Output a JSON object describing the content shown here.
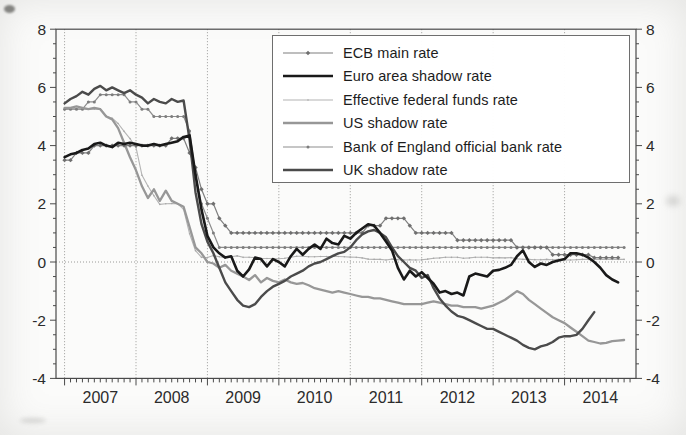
{
  "figure": {
    "background": "#fbfbfa",
    "frame_color": "#4a4a4a",
    "grid_color": "#9a9a98",
    "text_color": "#2b2b2b",
    "y_axis": {
      "min": -4,
      "max": 8,
      "tick_values": [
        8,
        6,
        4,
        2,
        0,
        -2,
        -4
      ],
      "tick_labels": [
        "8",
        "6",
        "4",
        "2",
        "0",
        "-2",
        "-4"
      ],
      "minor_tick_step": 0.5,
      "labels_on_both_sides": true
    },
    "x_axis": {
      "min": 2006.88,
      "max": 2015.0,
      "year_gridlines": [
        2007,
        2008,
        2009,
        2010,
        2011,
        2012,
        2013,
        2014
      ],
      "labels": [
        "2007",
        "2008",
        "2009",
        "2010",
        "2011",
        "2012",
        "2013",
        "2014"
      ],
      "minor_ticks": "monthly"
    }
  },
  "legend": {
    "position": "top-right",
    "items": [
      {
        "id": "ecb_main",
        "label": "ECB main rate"
      },
      {
        "id": "euro_shadow",
        "label": "Euro area shadow rate"
      },
      {
        "id": "fed_funds",
        "label": "Effective federal funds rate"
      },
      {
        "id": "us_shadow",
        "label": "US shadow rate"
      },
      {
        "id": "boe_rate",
        "label": "Bank of England official bank rate"
      },
      {
        "id": "uk_shadow",
        "label": "UK shadow rate"
      }
    ]
  },
  "chart_data": {
    "type": "line",
    "title": "",
    "xlabel": "",
    "ylabel": "",
    "ylim": [
      -4,
      8
    ],
    "xlim": [
      2006.88,
      2015.0
    ],
    "grid": "vertical year gridlines (dotted) + dotted zero line",
    "legend_position": "top-right inside frame",
    "x_unit": "monthly, value = year + (month-1)/12",
    "series": [
      {
        "id": "ecb_main",
        "name": "ECB main rate",
        "color": "#7f7f7f",
        "width": 1.2,
        "marker": "diamond",
        "marker_color": "#6f6f6f",
        "start": 2007.0,
        "values": [
          3.5,
          3.5,
          3.75,
          3.75,
          3.75,
          4.0,
          4.0,
          4.0,
          4.0,
          4.0,
          4.0,
          4.0,
          4.0,
          4.0,
          4.0,
          4.0,
          4.0,
          4.0,
          4.25,
          4.25,
          4.25,
          3.75,
          3.25,
          2.5,
          2.0,
          2.0,
          1.5,
          1.25,
          1.0,
          1.0,
          1.0,
          1.0,
          1.0,
          1.0,
          1.0,
          1.0,
          1.0,
          1.0,
          1.0,
          1.0,
          1.0,
          1.0,
          1.0,
          1.0,
          1.0,
          1.0,
          1.0,
          1.0,
          1.0,
          1.0,
          1.0,
          1.25,
          1.25,
          1.25,
          1.5,
          1.5,
          1.5,
          1.5,
          1.25,
          1.0,
          1.0,
          1.0,
          1.0,
          1.0,
          1.0,
          1.0,
          0.75,
          0.75,
          0.75,
          0.75,
          0.75,
          0.75,
          0.75,
          0.75,
          0.75,
          0.75,
          0.5,
          0.5,
          0.5,
          0.5,
          0.5,
          0.5,
          0.25,
          0.25,
          0.25,
          0.25,
          0.25,
          0.25,
          0.25,
          0.15,
          0.15,
          0.15,
          0.15,
          0.15
        ]
      },
      {
        "id": "euro_shadow",
        "name": "Euro area shadow rate",
        "color": "#191919",
        "width": 2.6,
        "marker": "none",
        "marker_color": "#191919",
        "start": 2007.0,
        "values": [
          3.6,
          3.7,
          3.75,
          3.85,
          3.9,
          4.05,
          4.1,
          4.0,
          3.95,
          4.1,
          4.05,
          4.1,
          4.05,
          4.0,
          4.0,
          4.05,
          4.0,
          4.05,
          4.1,
          4.15,
          4.3,
          4.35,
          3.0,
          1.8,
          0.9,
          0.5,
          0.3,
          0.15,
          0.2,
          -0.3,
          -0.5,
          -0.25,
          0.15,
          0.1,
          -0.15,
          0.1,
          0.0,
          -0.15,
          0.2,
          0.45,
          0.25,
          0.45,
          0.6,
          0.45,
          0.8,
          0.65,
          0.6,
          0.9,
          0.8,
          1.0,
          1.15,
          1.3,
          1.25,
          1.0,
          0.7,
          0.4,
          -0.2,
          -0.6,
          -0.3,
          -0.5,
          -0.35,
          -0.55,
          -0.75,
          -1.05,
          -1.0,
          -1.1,
          -1.05,
          -1.15,
          -0.5,
          -0.4,
          -0.45,
          -0.5,
          -0.3,
          -0.27,
          -0.2,
          -0.1,
          0.2,
          0.4,
          0.0,
          -0.17,
          -0.05,
          -0.1,
          0.0,
          0.05,
          0.1,
          0.3,
          0.3,
          0.25,
          0.15,
          0.0,
          -0.2,
          -0.45,
          -0.6,
          -0.7
        ]
      },
      {
        "id": "fed_funds",
        "name": "Effective federal funds rate",
        "color": "#b4b4b4",
        "width": 1.1,
        "marker": "dot",
        "marker_color": "#a8a8a8",
        "start": 2007.0,
        "values": [
          5.25,
          5.26,
          5.26,
          5.25,
          5.25,
          5.25,
          5.26,
          5.02,
          4.94,
          4.76,
          4.49,
          4.24,
          3.94,
          2.98,
          2.61,
          2.28,
          1.98,
          2.0,
          2.01,
          2.0,
          1.81,
          0.97,
          0.39,
          0.16,
          0.15,
          0.22,
          0.18,
          0.15,
          0.18,
          0.21,
          0.16,
          0.16,
          0.15,
          0.12,
          0.12,
          0.12,
          0.11,
          0.13,
          0.16,
          0.2,
          0.2,
          0.18,
          0.18,
          0.19,
          0.19,
          0.19,
          0.19,
          0.18,
          0.17,
          0.16,
          0.14,
          0.1,
          0.09,
          0.09,
          0.07,
          0.1,
          0.08,
          0.07,
          0.08,
          0.07,
          0.08,
          0.1,
          0.13,
          0.14,
          0.16,
          0.16,
          0.16,
          0.13,
          0.14,
          0.16,
          0.16,
          0.16,
          0.14,
          0.15,
          0.14,
          0.15,
          0.11,
          0.09,
          0.09,
          0.08,
          0.08,
          0.09,
          0.08,
          0.09,
          0.07,
          0.07,
          0.08,
          0.09,
          0.09,
          0.1,
          0.09,
          0.09,
          0.09,
          0.09,
          0.09
        ]
      },
      {
        "id": "us_shadow",
        "name": "US shadow rate",
        "color": "#979797",
        "width": 2.3,
        "marker": "none",
        "marker_color": "#979797",
        "start": 2007.0,
        "values": [
          5.3,
          5.3,
          5.35,
          5.3,
          5.25,
          5.3,
          5.25,
          5.0,
          4.9,
          4.6,
          4.1,
          3.6,
          3.15,
          2.6,
          2.2,
          2.5,
          2.1,
          2.45,
          2.1,
          2.0,
          1.9,
          1.2,
          0.5,
          0.3,
          0.0,
          -0.05,
          -0.2,
          -0.1,
          -0.3,
          -0.4,
          -0.5,
          -0.62,
          -0.45,
          -0.7,
          -0.55,
          -0.65,
          -0.7,
          -0.6,
          -0.7,
          -0.75,
          -0.72,
          -0.8,
          -0.9,
          -0.95,
          -1.0,
          -1.05,
          -1.0,
          -1.05,
          -1.1,
          -1.15,
          -1.2,
          -1.2,
          -1.25,
          -1.25,
          -1.3,
          -1.35,
          -1.4,
          -1.45,
          -1.45,
          -1.45,
          -1.45,
          -1.4,
          -1.35,
          -1.4,
          -1.45,
          -1.5,
          -1.5,
          -1.55,
          -1.55,
          -1.55,
          -1.6,
          -1.55,
          -1.5,
          -1.4,
          -1.3,
          -1.15,
          -1.0,
          -1.1,
          -1.3,
          -1.45,
          -1.6,
          -1.75,
          -1.9,
          -2.0,
          -2.1,
          -2.25,
          -2.4,
          -2.55,
          -2.7,
          -2.75,
          -2.8,
          -2.78,
          -2.72,
          -2.7,
          -2.68
        ]
      },
      {
        "id": "boe_rate",
        "name": "Bank of England official bank rate",
        "color": "#8d8d8d",
        "width": 1.2,
        "marker": "circle",
        "marker_color": "#7d7d7d",
        "start": 2007.0,
        "values": [
          5.25,
          5.25,
          5.25,
          5.25,
          5.5,
          5.5,
          5.75,
          5.75,
          5.75,
          5.75,
          5.75,
          5.5,
          5.5,
          5.25,
          5.25,
          5.0,
          5.0,
          5.0,
          5.0,
          5.0,
          5.0,
          4.5,
          3.0,
          2.0,
          1.5,
          1.0,
          0.5,
          0.5,
          0.5,
          0.5,
          0.5,
          0.5,
          0.5,
          0.5,
          0.5,
          0.5,
          0.5,
          0.5,
          0.5,
          0.5,
          0.5,
          0.5,
          0.5,
          0.5,
          0.5,
          0.5,
          0.5,
          0.5,
          0.5,
          0.5,
          0.5,
          0.5,
          0.5,
          0.5,
          0.5,
          0.5,
          0.5,
          0.5,
          0.5,
          0.5,
          0.5,
          0.5,
          0.5,
          0.5,
          0.5,
          0.5,
          0.5,
          0.5,
          0.5,
          0.5,
          0.5,
          0.5,
          0.5,
          0.5,
          0.5,
          0.5,
          0.5,
          0.5,
          0.5,
          0.5,
          0.5,
          0.5,
          0.5,
          0.5,
          0.5,
          0.5,
          0.5,
          0.5,
          0.5,
          0.5,
          0.5,
          0.5,
          0.5,
          0.5,
          0.5
        ]
      },
      {
        "id": "uk_shadow",
        "name": "UK shadow rate",
        "color": "#4b4b4b",
        "width": 2.4,
        "marker": "none",
        "marker_color": "#4b4b4b",
        "start": 2007.0,
        "values": [
          5.45,
          5.6,
          5.7,
          5.85,
          5.75,
          5.95,
          6.05,
          5.9,
          6.0,
          5.9,
          5.8,
          5.9,
          5.75,
          5.65,
          5.45,
          5.6,
          5.5,
          5.45,
          5.6,
          5.5,
          5.55,
          4.2,
          2.4,
          1.3,
          0.7,
          0.3,
          -0.2,
          -0.7,
          -1.0,
          -1.3,
          -1.5,
          -1.55,
          -1.45,
          -1.2,
          -1.0,
          -0.85,
          -0.75,
          -0.65,
          -0.5,
          -0.4,
          -0.3,
          -0.15,
          -0.05,
          0.0,
          0.1,
          0.2,
          0.3,
          0.35,
          0.5,
          0.75,
          0.95,
          1.05,
          1.1,
          1.0,
          0.85,
          0.5,
          0.2,
          0.0,
          -0.2,
          -0.3,
          -0.55,
          -0.45,
          -0.9,
          -1.25,
          -1.5,
          -1.7,
          -1.85,
          -1.9,
          -2.0,
          -2.1,
          -2.2,
          -2.3,
          -2.3,
          -2.4,
          -2.5,
          -2.6,
          -2.7,
          -2.85,
          -2.95,
          -3.0,
          -2.9,
          -2.85,
          -2.75,
          -2.6,
          -2.55,
          -2.55,
          -2.5,
          -2.3,
          -2.0,
          -1.72
        ]
      }
    ]
  }
}
